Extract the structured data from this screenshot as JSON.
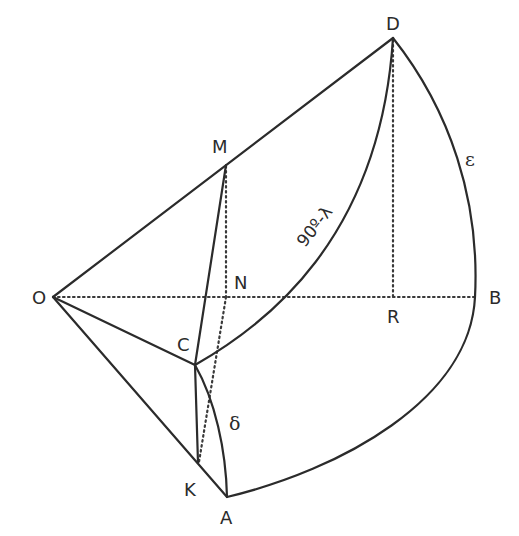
{
  "diagram": {
    "type": "spherical-geometry-construction",
    "background": "#ffffff",
    "stroke_color": "#2b2b2b",
    "points": [
      {
        "id": "O",
        "label": "O",
        "x": 53,
        "y": 297
      },
      {
        "id": "D",
        "label": "D",
        "x": 393,
        "y": 38
      },
      {
        "id": "M",
        "label": "M",
        "x": 226,
        "y": 165
      },
      {
        "id": "N",
        "label": "N",
        "x": 226,
        "y": 297
      },
      {
        "id": "R",
        "label": "R",
        "x": 393,
        "y": 297
      },
      {
        "id": "B",
        "label": "B",
        "x": 475,
        "y": 297
      },
      {
        "id": "C",
        "label": "C",
        "x": 195,
        "y": 365
      },
      {
        "id": "K",
        "label": "K",
        "x": 198,
        "y": 463
      },
      {
        "id": "A",
        "label": "A",
        "x": 227,
        "y": 497
      }
    ],
    "solid_segments": [
      "O-D",
      "O-C",
      "O-A",
      "M-C",
      "C-K"
    ],
    "dotted_segments": [
      "O-B",
      "D-R",
      "M-N",
      "N-K"
    ],
    "arcs": [
      {
        "from": "C",
        "to": "D",
        "label": "90º-λ"
      },
      {
        "from": "D",
        "to": "A",
        "via": "B",
        "label": "ε"
      },
      {
        "from": "C",
        "to": "A",
        "label": "δ"
      }
    ],
    "arc_labels": {
      "colatitude": "90º-λ",
      "epsilon": "ε",
      "delta": "δ"
    }
  }
}
